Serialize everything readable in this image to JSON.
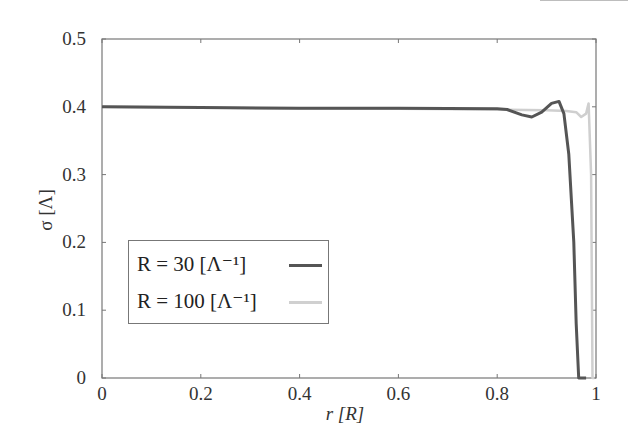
{
  "chart_data": {
    "type": "line",
    "title": "",
    "xlabel": "r [R]",
    "ylabel": "σ [Λ]",
    "xlim": [
      0,
      1
    ],
    "ylim": [
      0,
      0.5
    ],
    "x_ticks": [
      "0",
      "0.2",
      "0.4",
      "0.6",
      "0.8",
      "1"
    ],
    "y_ticks": [
      "0",
      "0.1",
      "0.2",
      "0.3",
      "0.4",
      "0.5"
    ],
    "grid": false,
    "legend_position": "lower left",
    "series": [
      {
        "name": "R = 30 [Λ⁻¹]",
        "color": "#555555",
        "x": [
          0,
          0.2,
          0.4,
          0.6,
          0.8,
          0.82,
          0.85,
          0.87,
          0.89,
          0.91,
          0.925,
          0.935,
          0.945,
          0.955,
          0.96,
          0.965,
          0.98
        ],
        "y": [
          0.4,
          0.399,
          0.398,
          0.398,
          0.397,
          0.396,
          0.388,
          0.385,
          0.392,
          0.405,
          0.408,
          0.39,
          0.33,
          0.2,
          0.08,
          0.0,
          0.0
        ]
      },
      {
        "name": "R = 100 [Λ⁻¹]",
        "color": "#cfcfcf",
        "x": [
          0,
          0.2,
          0.4,
          0.6,
          0.8,
          0.9,
          0.94,
          0.96,
          0.97,
          0.98,
          0.985,
          0.99,
          0.993,
          0.997
        ],
        "y": [
          0.4,
          0.399,
          0.398,
          0.397,
          0.396,
          0.395,
          0.394,
          0.392,
          0.385,
          0.39,
          0.405,
          0.3,
          0.0,
          0.0
        ]
      }
    ]
  },
  "legend": {
    "items": [
      {
        "label": "R = 30 [Λ⁻¹]",
        "color": "#555555"
      },
      {
        "label": "R = 100 [Λ⁻¹]",
        "color": "#cfcfcf"
      }
    ]
  },
  "axes": {
    "xlabel": "r [R]",
    "ylabel": "σ [Λ]"
  }
}
